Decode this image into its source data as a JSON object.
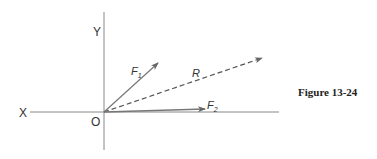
{
  "figure": {
    "caption": "Figure 13-24",
    "axes": {
      "x_label": "X",
      "y_label": "Y",
      "origin_label": "O"
    },
    "vectors": [
      {
        "name": "F1",
        "label": "F",
        "subscript": "1",
        "style": "solid"
      },
      {
        "name": "R",
        "label": "R",
        "subscript": "",
        "style": "dashed"
      },
      {
        "name": "F2",
        "label": "F",
        "subscript": "2",
        "style": "solid"
      }
    ],
    "colors": {
      "line": "#777777",
      "text": "#333333"
    }
  }
}
